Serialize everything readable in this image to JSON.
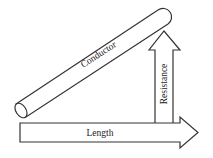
{
  "diagram": {
    "title": "",
    "elements": {
      "conductor": {
        "label": "Conductor"
      },
      "resistance_arrow": {
        "label": "Resistance",
        "direction": "up"
      },
      "length_arrow": {
        "label": "Length",
        "direction": "right"
      }
    },
    "colors": {
      "stroke": "#333333",
      "fill": "#ffffff",
      "text": "#222222"
    }
  }
}
